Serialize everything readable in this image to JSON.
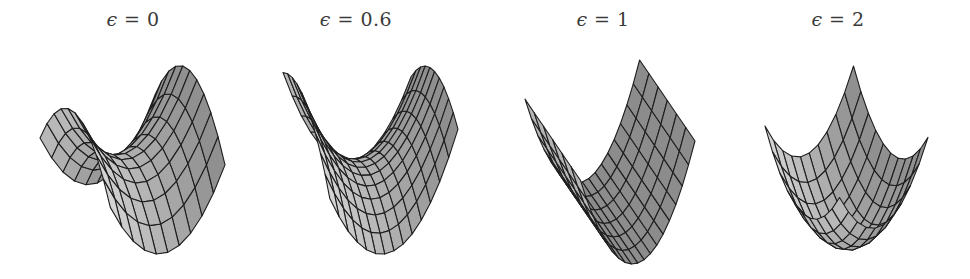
{
  "figure": {
    "colors": {
      "background": "#ffffff",
      "mesh_line": "#1e1e1e",
      "title_text": "#3a3a3a",
      "fill_light": "#f2f2f2",
      "fill_dark": "#6a6a6a"
    },
    "panels": [
      {
        "title_symbol": "ϵ",
        "title_rest": " = 0",
        "epsilon": 0,
        "box": {
          "x": 40,
          "w": 185,
          "top": 66,
          "bottom": 254
        },
        "title_center_x": 133,
        "view": {
          "yaw": -0.55,
          "pitch": 0.55
        },
        "grid": {
          "nu": 10,
          "nv": 10
        },
        "shape": "saddle"
      },
      {
        "title_symbol": "ϵ",
        "title_rest": " = 0.6",
        "epsilon": 0.6,
        "box": {
          "x": 283,
          "w": 175,
          "top": 66,
          "bottom": 254
        },
        "title_center_x": 356,
        "view": {
          "yaw": -0.35,
          "pitch": 0.5
        },
        "grid": {
          "nu": 14,
          "nv": 10
        },
        "shape": "saddle"
      },
      {
        "title_symbol": "ϵ",
        "title_rest": " = 1",
        "epsilon": 1,
        "box": {
          "x": 525,
          "w": 170,
          "top": 60,
          "bottom": 264
        },
        "title_center_x": 603,
        "view": {
          "yaw": -0.45,
          "pitch": 0.45
        },
        "grid": {
          "nu": 18,
          "nv": 6
        },
        "shape": "cylinder"
      },
      {
        "title_symbol": "ϵ",
        "title_rest": " = 2",
        "epsilon": 2,
        "box": {
          "x": 765,
          "w": 163,
          "top": 66,
          "bottom": 250
        },
        "title_center_x": 838,
        "view": {
          "yaw": -0.7,
          "pitch": 0.55
        },
        "grid": {
          "nu": 10,
          "nv": 10
        },
        "shape": "bowl"
      }
    ]
  }
}
